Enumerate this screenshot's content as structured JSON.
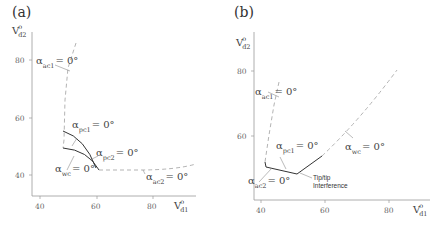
{
  "panels": [
    {
      "id": "a",
      "label": "(a)",
      "y_axis": {
        "label": "V",
        "sup": "o",
        "sub": "d2",
        "ticks": [
          "80",
          "60",
          "40"
        ]
      },
      "x_axis": {
        "label": "V",
        "sup": "o",
        "sub": "d1",
        "ticks": [
          "40",
          "60",
          "80"
        ]
      },
      "annotations": [
        {
          "alpha": "α",
          "sub": "ac1",
          "eq": "= 0°"
        },
        {
          "alpha": "α",
          "sub": "pc1",
          "eq": "= 0°"
        },
        {
          "alpha": "α",
          "sub": "pc2",
          "eq": "= 0°"
        },
        {
          "alpha": "α",
          "sub": "wc",
          "eq": "= 0°"
        },
        {
          "alpha": "α",
          "sub": "ac2",
          "eq": "= 0°"
        }
      ]
    },
    {
      "id": "b",
      "label": "(b)",
      "y_axis": {
        "label": "V",
        "sup": "o",
        "sub": "d2",
        "ticks": [
          "80",
          "60",
          "40"
        ]
      },
      "x_axis": {
        "label": "V",
        "sup": "o",
        "sub": "d1",
        "ticks": [
          "40",
          "60",
          "80"
        ]
      },
      "annotations": [
        {
          "alpha": "α",
          "sub": "ac1",
          "eq": "= 0°"
        },
        {
          "alpha": "α",
          "sub": "pc1",
          "eq": "= 0°"
        },
        {
          "alpha": "α",
          "sub": "wc",
          "eq": "= 0°"
        },
        {
          "alpha": "α",
          "sub": "ac2",
          "eq": "= 0°"
        }
      ],
      "note": [
        "Tip/tip",
        "Interference"
      ]
    }
  ]
}
